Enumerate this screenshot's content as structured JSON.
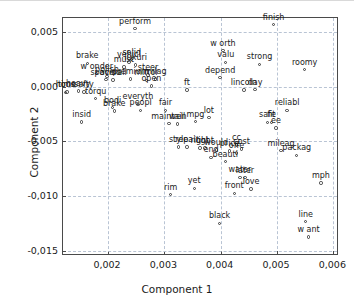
{
  "chart_data": {
    "type": "scatter",
    "title": "",
    "xlabel": "Component 1",
    "ylabel": "Component 2",
    "xlim": [
      0.0012,
      0.0061
    ],
    "ylim": [
      -0.0155,
      0.0063
    ],
    "xticks": [
      0.002,
      0.003,
      0.004,
      0.005,
      0.006
    ],
    "xticklabels": [
      "0,002",
      "0,003",
      "0,004",
      "0,005",
      "0,006"
    ],
    "yticks": [
      0.005,
      0.0,
      -0.005,
      -0.01,
      -0.015
    ],
    "yticklabels": [
      "0,005",
      "0,000",
      "-0,005",
      "-0,010",
      "-0,015"
    ],
    "grid": true,
    "legend": null,
    "marker": "open-circle",
    "points": [
      {
        "label": "perform",
        "x": 0.00248,
        "y": 0.00533
      },
      {
        "label": "finish",
        "x": 0.00494,
        "y": 0.00568
      },
      {
        "label": "worth",
        "x": 0.00404,
        "y": 0.00332
      },
      {
        "label": "valu",
        "x": 0.00409,
        "y": 0.00225
      },
      {
        "label": "strong",
        "x": 0.00469,
        "y": 0.00205
      },
      {
        "label": "roomy",
        "x": 0.00549,
        "y": 0.00157
      },
      {
        "label": "solid",
        "x": 0.00242,
        "y": 0.00248
      },
      {
        "label": "luxuri",
        "x": 0.00249,
        "y": 0.00198
      },
      {
        "label": "vehicl",
        "x": 0.00237,
        "y": 0.00228
      },
      {
        "label": "must",
        "x": 0.00228,
        "y": 0.00183
      },
      {
        "label": "brake",
        "x": 0.00163,
        "y": 0.00214
      },
      {
        "label": "wonder",
        "x": 0.0018,
        "y": 0.00119
      },
      {
        "label": "polish",
        "x": 0.00198,
        "y": 0.00094
      },
      {
        "label": "spaciou",
        "x": 0.00196,
        "y": 0.00065
      },
      {
        "label": "overall",
        "x": 0.00209,
        "y": 0.00063
      },
      {
        "label": "premium",
        "x": 0.0024,
        "y": 0.0007
      },
      {
        "label": "steer",
        "x": 0.00271,
        "y": 0.00108
      },
      {
        "label": "mirror",
        "x": 0.00268,
        "y": 0.0006
      },
      {
        "label": "milag",
        "x": 0.00284,
        "y": 0.0007
      },
      {
        "label": "open",
        "x": 0.00277,
        "y": 8e-05
      },
      {
        "label": "depend",
        "x": 0.00399,
        "y": 0.00083
      },
      {
        "label": "ft",
        "x": 0.0034,
        "y": -0.00028
      },
      {
        "label": "lincoln",
        "x": 0.00441,
        "y": -0.0003
      },
      {
        "label": "day",
        "x": 0.00461,
        "y": -0.00027
      },
      {
        "label": "heavy",
        "x": 0.00147,
        "y": -0.0004
      },
      {
        "label": "hous",
        "x": 0.00124,
        "y": -0.0005
      },
      {
        "label": "time",
        "x": 0.00127,
        "y": -0.00049
      },
      {
        "label": "safty",
        "x": 0.00157,
        "y": -0.00048
      },
      {
        "label": "torqu",
        "x": 0.00178,
        "y": -0.0011
      },
      {
        "label": "bodi",
        "x": 0.00208,
        "y": -0.00192
      },
      {
        "label": "brake2",
        "x": 0.00211,
        "y": -0.00222
      },
      {
        "label": "everyth",
        "x": 0.00253,
        "y": -0.00162
      },
      {
        "label": "peopl",
        "x": 0.00258,
        "y": -0.00215
      },
      {
        "label": "fair",
        "x": 0.00302,
        "y": -0.00215
      },
      {
        "label": "reliabl",
        "x": 0.00518,
        "y": -0.00215
      },
      {
        "label": "insid",
        "x": 0.00153,
        "y": -0.00322
      },
      {
        "label": "maintain",
        "x": 0.00308,
        "y": -0.00337
      },
      {
        "label": "well",
        "x": 0.00323,
        "y": -0.0034
      },
      {
        "label": "mpg",
        "x": 0.00355,
        "y": -0.0032
      },
      {
        "label": "lot",
        "x": 0.00379,
        "y": -0.00282
      },
      {
        "label": "safe",
        "x": 0.00483,
        "y": -0.00326
      },
      {
        "label": "fit",
        "x": 0.0049,
        "y": -0.00327
      },
      {
        "label": "ee",
        "x": 0.00498,
        "y": -0.00378
      },
      {
        "label": "style",
        "x": 0.00325,
        "y": -0.0055
      },
      {
        "label": "repair",
        "x": 0.0034,
        "y": -0.00552
      },
      {
        "label": "right",
        "x": 0.00363,
        "y": -0.0056
      },
      {
        "label": "light",
        "x": 0.00372,
        "y": -0.00562
      },
      {
        "label": "would",
        "x": 0.00392,
        "y": -0.0058
      },
      {
        "label": "cc",
        "x": 0.00428,
        "y": -0.00533
      },
      {
        "label": "price",
        "x": 0.00416,
        "y": -0.00588
      },
      {
        "label": "cost",
        "x": 0.00437,
        "y": -0.0057
      },
      {
        "label": "offer",
        "x": 0.00428,
        "y": -0.00605
      },
      {
        "label": "end",
        "x": 0.00383,
        "y": -0.00645
      },
      {
        "label": "beauti",
        "x": 0.00408,
        "y": -0.00685
      },
      {
        "label": "mileag",
        "x": 0.00507,
        "y": -0.00585
      },
      {
        "label": "packag",
        "x": 0.00535,
        "y": -0.00628
      },
      {
        "label": "water",
        "x": 0.00434,
        "y": -0.0083
      },
      {
        "label": "later",
        "x": 0.00443,
        "y": -0.00832
      },
      {
        "label": "mph",
        "x": 0.00578,
        "y": -0.0088
      },
      {
        "label": "rim",
        "x": 0.00311,
        "y": -0.00988
      },
      {
        "label": "yet",
        "x": 0.00353,
        "y": -0.0093
      },
      {
        "label": "front",
        "x": 0.00424,
        "y": -0.00975
      },
      {
        "label": "love",
        "x": 0.00454,
        "y": -0.00938
      },
      {
        "label": "black",
        "x": 0.00398,
        "y": -0.0125
      },
      {
        "label": "line",
        "x": 0.00551,
        "y": -0.01235
      },
      {
        "label": "want",
        "x": 0.00556,
        "y": -0.01375
      }
    ]
  },
  "labels_display": {
    "perform": "perform",
    "finish": "finish",
    "worth": "w orth",
    "valu": "valu",
    "strong": "strong",
    "roomy": "roomy",
    "solid": "solid",
    "luxuri": "luxuri",
    "vehicl": "vehicl",
    "must": "must",
    "brake": "brake",
    "wonder": "w onder",
    "polish": "polish",
    "spaciou": "spaciou",
    "overall": "overall",
    "premium": "premium",
    "steer": "steer",
    "mirror": "mirror",
    "milag": "milag",
    "open": "open",
    "depend": "depend",
    "ft": "ft",
    "lincoln": "lincoln",
    "day": "day",
    "heavy": "heavy",
    "hous": "hous",
    "time": "time",
    "safty": "safty",
    "torqu": "torqu",
    "bodi": "bodi",
    "brake2": "brake",
    "everyth": "everyth",
    "peopl": "peopl",
    "fair": "fair",
    "reliabl": "reliabl",
    "insid": "insid",
    "maintain": "maintain",
    "well": "well",
    "mpg": "mpg",
    "lot": "lot",
    "safe": "safe",
    "fit": "fit",
    "ee": "ee",
    "style": "style",
    "repair": "repair",
    "right": "right",
    "light": "light",
    "would": "would",
    "cc": "cc",
    "price": "price",
    "cost": "cost",
    "offer": "offe",
    "end": "end",
    "beauti": "beauti",
    "mileag": "mileag",
    "packag": "packag",
    "water": "water",
    "later": "later",
    "mph": "mph",
    "rim": "rim",
    "yet": "yet",
    "front": "front",
    "love": "love",
    "black": "black",
    "line": "line",
    "want": "w ant"
  }
}
